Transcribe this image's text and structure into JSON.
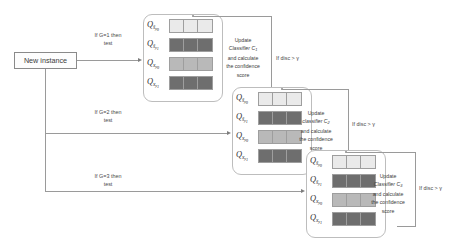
{
  "diagram": {
    "source_node": {
      "label": "New instance"
    },
    "branch_labels": [
      {
        "line1": "If G=1 then",
        "line2": "test"
      },
      {
        "line1": "If G=2 then",
        "line2": "test"
      },
      {
        "line1": "If G=3 then",
        "line2": "test"
      }
    ],
    "feedback_labels": [
      "If disc > γ",
      "If disc > γ",
      "If disc > γ"
    ],
    "q_rows": [
      {
        "base": "Q",
        "sub_var": "ŝ",
        "sub_class": "y",
        "sub_index": "0",
        "shade": "#eaeaea"
      },
      {
        "base": "Q",
        "sub_var": "ŝ",
        "sub_class": "y",
        "sub_index": "1",
        "shade": "#6e6e6e"
      },
      {
        "base": "Q",
        "sub_var": "x",
        "sub_class": "y",
        "sub_index": "0",
        "shade": "#b9b9b9"
      },
      {
        "base": "Q",
        "sub_var": "x",
        "sub_class": "y",
        "sub_index": "1",
        "shade": "#6e6e6e"
      }
    ],
    "cells_per_row": 3,
    "stages": [
      {
        "name": "stage-1",
        "update_text": {
          "line1": "Update",
          "line2": "Classifier",
          "classifier": "C",
          "classifier_index": "1",
          "line3": "and calculate",
          "line4": "the confidence",
          "line5": "score"
        }
      },
      {
        "name": "stage-2",
        "update_text": {
          "line1": "Update",
          "line2": "classifier",
          "classifier": "C",
          "classifier_index": "2",
          "line3": "and calculate",
          "line4": "the confidence",
          "line5": "score"
        }
      },
      {
        "name": "stage-3",
        "update_text": {
          "line1": "Update",
          "line2": "Classifier",
          "classifier": "C",
          "classifier_index": "3",
          "line3": "and calculate",
          "line4": "the confidence",
          "line5": "score"
        }
      }
    ],
    "colors": {
      "line": "#9a9a9a",
      "stage_border": "#bdbdbd",
      "cell_border": "#9e9e9e",
      "text": "#3d3d3d",
      "shade_lightest": "#eaeaea",
      "shade_light": "#b9b9b9",
      "shade_dark": "#6e6e6e"
    }
  }
}
